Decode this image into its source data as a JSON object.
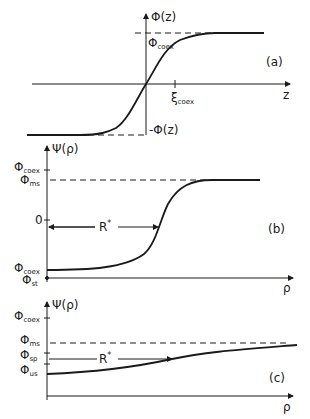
{
  "figure": {
    "panels": [
      {
        "id": "a",
        "tag": "(a)",
        "y_axis_label": "Φ(z)",
        "x_axis_label": "z",
        "upper_level_label": "Φ",
        "upper_level_sub": "coex",
        "lower_level_label": "-Φ(z)",
        "x_tick_label": "ξ",
        "x_tick_sub": "coex"
      },
      {
        "id": "b",
        "tag": "(b)",
        "y_axis_label": "Ψ(ρ)",
        "x_axis_label": "ρ",
        "y_ticks": [
          {
            "label": "Φ",
            "sub": "coex"
          },
          {
            "label": "Φ",
            "sub": "ms"
          },
          {
            "label": "0",
            "sub": ""
          },
          {
            "label": "Φ",
            "sub": "coex"
          },
          {
            "label": "Φ",
            "sub": "st"
          }
        ],
        "radius_label": "R",
        "radius_sup": "*"
      },
      {
        "id": "c",
        "tag": "(c)",
        "y_axis_label": "Ψ(ρ)",
        "x_axis_label": "ρ",
        "y_ticks": [
          {
            "label": "Φ",
            "sub": "coex"
          },
          {
            "label": "Φ",
            "sub": "ms"
          },
          {
            "label": "Φ",
            "sub": "sp"
          },
          {
            "label": "Φ",
            "sub": "us"
          }
        ],
        "radius_label": "R",
        "radius_sup": "*"
      }
    ],
    "stroke_color": "#1a1a1a"
  }
}
